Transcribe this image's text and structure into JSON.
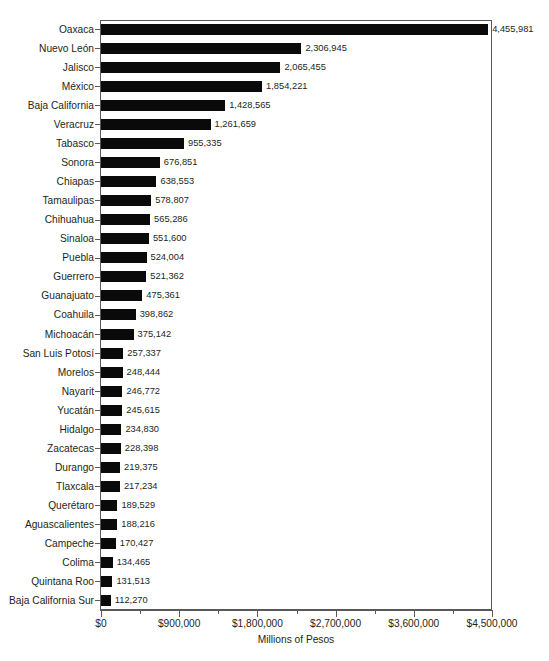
{
  "chart_data": {
    "type": "bar",
    "orientation": "horizontal",
    "title": "",
    "xlabel": "Millions of Pesos",
    "ylabel": "",
    "xlim": [
      0,
      4500000
    ],
    "xticks": [
      0,
      900000,
      1800000,
      2700000,
      3600000,
      4500000
    ],
    "xticklabels": [
      "$0",
      "$900,000",
      "$1,800,000",
      "$2,700,000",
      "$3,600,000",
      "$4,500,000"
    ],
    "grid": false,
    "legend": null,
    "bar_color": "#0a0a0a",
    "axis_color": "#58595b",
    "background": "#ffffff",
    "categories": [
      "Oaxaca",
      "Nuevo León",
      "Jalisco",
      "México",
      "Baja California",
      "Veracruz",
      "Tabasco",
      "Sonora",
      "Chiapas",
      "Tamaulipas",
      "Chihuahua",
      "Sinaloa",
      "Puebla",
      "Guerrero",
      "Guanajuato",
      "Coahuila",
      "Michoacán",
      "San Luis Potosí",
      "Morelos",
      "Nayarit",
      "Yucatán",
      "Hidalgo",
      "Zacatecas",
      "Durango",
      "Tlaxcala",
      "Querétaro",
      "Aguascalientes",
      "Campeche",
      "Colima",
      "Quintana Roo",
      "Baja California Sur"
    ],
    "values": [
      4455981,
      2306945,
      2065455,
      1854221,
      1428565,
      1261659,
      955335,
      676851,
      638553,
      578807,
      565286,
      551600,
      524004,
      521362,
      475361,
      398862,
      375142,
      257337,
      248444,
      246772,
      245615,
      234830,
      228398,
      219375,
      217234,
      189529,
      188216,
      170427,
      134465,
      131513,
      112270
    ],
    "data_labels": [
      "4,455,981",
      "2,306,945",
      "2,065,455",
      "1,854,221",
      "1,428,565",
      "1,261,659",
      "955,335",
      "676,851",
      "638,553",
      "578,807",
      "565,286",
      "551,600",
      "524,004",
      "521,362",
      "475,361",
      "398,862",
      "375,142",
      "257,337",
      "248,444",
      "246,772",
      "245,615",
      "234,830",
      "228,398",
      "219,375",
      "217,234",
      "189,529",
      "188,216",
      "170,427",
      "134,465",
      "131,513",
      "112,270"
    ]
  }
}
